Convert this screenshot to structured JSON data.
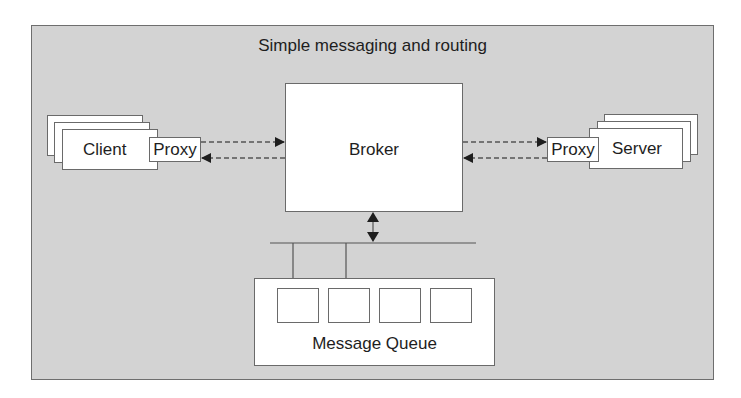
{
  "diagram": {
    "title": "Simple messaging and routing",
    "nodes": {
      "client": {
        "label": "Client",
        "stack_count": 3
      },
      "client_proxy": {
        "label": "Proxy"
      },
      "broker": {
        "label": "Broker"
      },
      "server_proxy": {
        "label": "Proxy"
      },
      "server": {
        "label": "Server",
        "stack_count": 3
      },
      "message_queue": {
        "label": "Message Queue",
        "slot_count": 4
      }
    },
    "edges": [
      {
        "from": "client_proxy",
        "to": "broker",
        "style": "dashed",
        "direction": "forward"
      },
      {
        "from": "broker",
        "to": "client_proxy",
        "style": "dashed",
        "direction": "forward"
      },
      {
        "from": "broker",
        "to": "server_proxy",
        "style": "dashed",
        "direction": "forward"
      },
      {
        "from": "server_proxy",
        "to": "broker",
        "style": "dashed",
        "direction": "forward"
      },
      {
        "from": "broker",
        "to": "bus",
        "style": "solid",
        "direction": "bidirectional"
      },
      {
        "from": "bus",
        "to": "message_queue",
        "style": "solid",
        "direction": "none",
        "connectors": 2
      }
    ],
    "colors": {
      "frame_background": "#d3d3d3",
      "frame_border": "#6e6e6e",
      "box_fill": "#ffffff",
      "line": "#555555",
      "text": "#1e1e1e"
    }
  }
}
